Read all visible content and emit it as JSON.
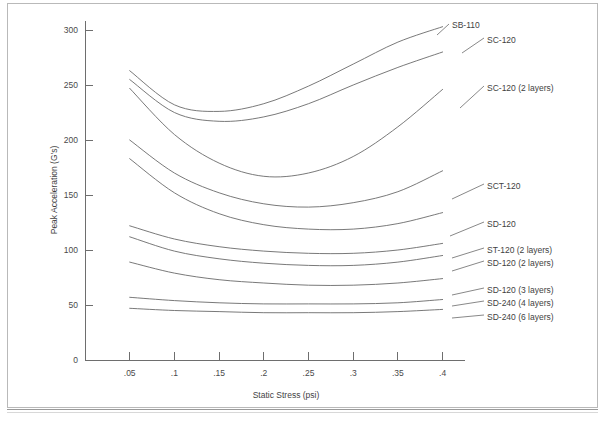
{
  "chart_data": {
    "type": "line",
    "title": "",
    "xlabel": "Static Stress (psi)",
    "ylabel": "Peak Acceleration (G's)",
    "xlim": [
      0.0,
      0.425
    ],
    "ylim": [
      0,
      310
    ],
    "grid": false,
    "legend_position": "right-inline-labels",
    "xticks": [
      0.05,
      0.1,
      0.15,
      0.2,
      0.25,
      0.3,
      0.35,
      0.4
    ],
    "xticklabels": [
      ".05",
      ".1",
      ".15",
      ".2",
      ".25",
      ".3",
      ".35",
      ".4"
    ],
    "yticks": [
      0,
      50,
      100,
      150,
      200,
      250,
      300
    ],
    "yticklabels": [
      "0",
      "50",
      "100",
      "150",
      "200",
      "250",
      "300"
    ],
    "x": [
      0.05,
      0.1,
      0.15,
      0.2,
      0.25,
      0.3,
      0.35,
      0.4
    ],
    "series": [
      {
        "name": "SB-110",
        "label": "SB-110",
        "values": [
          263,
          232,
          226,
          233,
          249,
          269,
          289,
          303
        ],
        "label_x": 452,
        "label_y": 25,
        "leader_from_x": 437,
        "leader_from_y": 35,
        "leader_to_x": 449,
        "leader_to_y": 24
      },
      {
        "name": "SC-120",
        "label": "SC-120",
        "values": [
          255,
          225,
          217,
          221,
          233,
          250,
          266,
          280
        ],
        "label_x": 487,
        "label_y": 40,
        "leader_from_x": 462,
        "leader_from_y": 53,
        "leader_to_x": 484,
        "leader_to_y": 38
      },
      {
        "name": "SC-120 (2 layers)",
        "label": "SC-120 (2 layers)",
        "values": [
          247,
          205,
          179,
          167,
          170,
          185,
          212,
          246
        ],
        "label_x": 487,
        "label_y": 88,
        "leader_from_x": 460,
        "leader_from_y": 108,
        "leader_to_x": 484,
        "leader_to_y": 86
      },
      {
        "name": "SCT-120",
        "label": "SCT-120",
        "values": [
          200,
          170,
          152,
          142,
          139,
          143,
          153,
          172
        ],
        "label_x": 487,
        "label_y": 186,
        "leader_from_x": 452,
        "leader_from_y": 199,
        "leader_to_x": 484,
        "leader_to_y": 184
      },
      {
        "name": "SD-120",
        "label": "SD-120",
        "values": [
          183,
          152,
          133,
          123,
          119,
          119,
          124,
          134
        ],
        "label_x": 487,
        "label_y": 224,
        "leader_from_x": 450,
        "leader_from_y": 236,
        "leader_to_x": 484,
        "leader_to_y": 222
      },
      {
        "name": "ST-120 (2 layers)",
        "label": "ST-120 (2 layers)",
        "values": [
          122,
          110,
          103,
          99,
          97,
          97,
          100,
          106
        ],
        "label_x": 487,
        "label_y": 250,
        "leader_from_x": 452,
        "leader_from_y": 258,
        "leader_to_x": 484,
        "leader_to_y": 248
      },
      {
        "name": "SD-120 (2 layers)",
        "label": "SD-120 (2 layers)",
        "values": [
          112,
          99,
          92,
          88,
          86,
          86,
          89,
          95
        ],
        "label_x": 487,
        "label_y": 263,
        "leader_from_x": 452,
        "leader_from_y": 271,
        "leader_to_x": 484,
        "leader_to_y": 261
      },
      {
        "name": "SD-120 (3 layers)",
        "label": "SD-120 (3 layers)",
        "values": [
          89,
          79,
          73,
          70,
          68,
          68,
          70,
          74
        ],
        "label_x": 487,
        "label_y": 290,
        "leader_from_x": 452,
        "leader_from_y": 295,
        "leader_to_x": 484,
        "leader_to_y": 288
      },
      {
        "name": "SD-240 (4 layers)",
        "label": "SD-240 (4 layers)",
        "values": [
          57,
          54,
          52,
          51,
          51,
          51,
          52,
          55
        ],
        "label_x": 487,
        "label_y": 303,
        "leader_from_x": 452,
        "leader_from_y": 306,
        "leader_to_x": 484,
        "leader_to_y": 301
      },
      {
        "name": "SD-240 (6 layers)",
        "label": "SD-240 (6 layers)",
        "values": [
          47,
          45,
          44,
          43,
          43,
          43,
          44,
          46
        ],
        "label_x": 487,
        "label_y": 317,
        "leader_from_x": 452,
        "leader_from_y": 318,
        "leader_to_x": 484,
        "leader_to_y": 315
      }
    ]
  },
  "figure": {
    "plot_left_px": 85,
    "plot_bottom_px": 360,
    "plot_top_px": 21,
    "x_scale_px_per_unit": 894,
    "y_scale_px_per_unit": 1.1,
    "axis_color": "#6e6e6e",
    "line_color": "#6a6a6a",
    "text_color": "#3f3f3f",
    "background": "#ffffff"
  }
}
